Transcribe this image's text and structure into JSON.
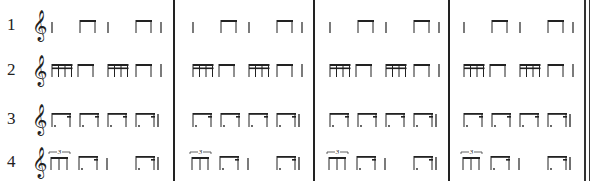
{
  "sheet": {
    "title": "Rhythm exercises",
    "clef_glyph": "𝄞",
    "rows": [
      {
        "label": "1",
        "pattern": [
          "quarter",
          "eighth-pair",
          "quarter",
          "eighth-pair",
          "quarter-end"
        ]
      },
      {
        "label": "2",
        "pattern": [
          "sixteenth-group",
          "eighth-pair",
          "sixteenth-group",
          "eighth-pair",
          "quarter-end"
        ]
      },
      {
        "label": "3",
        "pattern": [
          "dotted-eighth-sixteenth",
          "dotted-eighth-sixteenth",
          "dotted-eighth-sixteenth",
          "dotted-eighth-sixteenth"
        ]
      },
      {
        "label": "4",
        "pattern": [
          "eighth-triplet",
          "dotted-eighth-sixteenth",
          "quarter",
          "dotted-eighth-sixteenth"
        ]
      }
    ],
    "measures": 4,
    "triplet_label": "3",
    "barlines_x": [
      174,
      314,
      449
    ],
    "final_barline": "double",
    "ink_color": "#222222"
  }
}
